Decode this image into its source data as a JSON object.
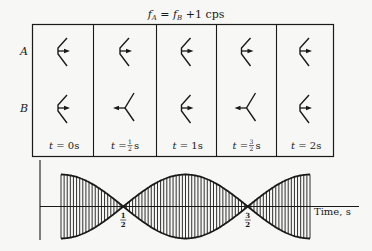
{
  "title": {
    "fA": "f",
    "fA_sub": "A",
    "eq": " = ",
    "fB": "f",
    "fB_sub": "B",
    "rest": " +1 cps"
  },
  "rows": [
    {
      "label": "A",
      "arrows": [
        "right",
        "right",
        "right",
        "right",
        "right"
      ]
    },
    {
      "label": "B",
      "arrows": [
        "right",
        "left",
        "right",
        "left",
        "right"
      ]
    }
  ],
  "time_labels": [
    {
      "prefix": "t = ",
      "value": "0",
      "unit": "s"
    },
    {
      "prefix": "t = ",
      "num": "1",
      "den": "2",
      "unit": " s"
    },
    {
      "prefix": "t = ",
      "value": "1",
      "unit": "s"
    },
    {
      "prefix": "t = ",
      "num": "3",
      "den": "2",
      "unit": " s"
    },
    {
      "prefix": "t = ",
      "value": "2",
      "unit": "s"
    }
  ],
  "waveform": {
    "x_axis_label": "Time, s",
    "node_labels": [
      {
        "num": "1",
        "den": "2"
      },
      {
        "num": "3",
        "den": "2"
      }
    ],
    "beat_frequency_cps": 1,
    "time_range_s": [
      0,
      2
    ]
  },
  "colors": {
    "ink": "#1a1a1a",
    "paper": "#f7f7f5"
  }
}
